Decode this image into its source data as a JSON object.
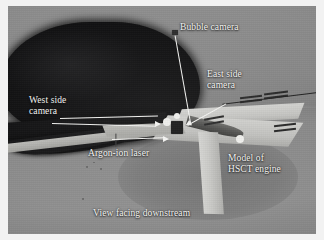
{
  "figure": {
    "caption": "View facing downstream",
    "background_color": "#8a8a8a",
    "label_color": "#f6f6f4",
    "dark_mass_color": "#0d0d0e",
    "blade_color": "#c9c9c6",
    "leader_color": "#f4f4f2"
  },
  "annotations": [
    {
      "id": "bubble-camera",
      "text": "Bubble camera",
      "x": 172,
      "y": 22
    },
    {
      "id": "east-side-camera",
      "text": "East side\ncamera",
      "x": 207,
      "y": 69
    },
    {
      "id": "west-side-camera",
      "text": "West side\ncamera",
      "x": 29,
      "y": 95
    },
    {
      "id": "argon-ion-laser",
      "text": "Argon-ion laser",
      "x": 88,
      "y": 148
    },
    {
      "id": "model-hsct-engine",
      "text": "Model of\nHSCT engine",
      "x": 228,
      "y": 153
    },
    {
      "id": "view-facing-downstream",
      "text": "View facing downstream",
      "x": 93,
      "y": 208
    }
  ],
  "scene_elements": {
    "dark_mass_label": "tunnel shroud opening",
    "blades_label": "model fan blades",
    "pylon_label": "engine pylon",
    "floor_label": "tunnel floor"
  }
}
